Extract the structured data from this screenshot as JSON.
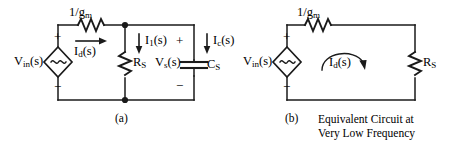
{
  "figure": {
    "stroke_color": "#1a1a1a",
    "background": "#ffffff",
    "panels": [
      {
        "id": "panel-a",
        "caption": "(a)",
        "source": {
          "label": "V",
          "label_sub": "in",
          "label_tail": "(s)",
          "symbol": "~",
          "plus": "+",
          "minus": "−",
          "type": "dependent-ac-source"
        },
        "series_resistor": {
          "label": "1/g",
          "label_sub": "m",
          "current_label": "I",
          "current_sub": "d",
          "current_tail": "(s)",
          "current_direction": "right"
        },
        "shunt_resistor": {
          "label": "R",
          "label_sub": "S",
          "current_label": "I",
          "current_sub": "1",
          "current_tail": "(s)",
          "current_direction": "down"
        },
        "capacitor": {
          "label": "C",
          "label_sub": "S",
          "current_label": "I",
          "current_sub": "c",
          "current_tail": "(s)",
          "current_direction": "down"
        },
        "node_voltage": {
          "label": "V",
          "label_sub": "s",
          "label_tail": "(s)",
          "plus": "+",
          "minus": "−"
        }
      },
      {
        "id": "panel-b",
        "caption_tag": "(b)",
        "caption_line1": "Equivalent Circuit at",
        "caption_line2": "Very Low Frequency",
        "source": {
          "label": "V",
          "label_sub": "in",
          "label_tail": "(s)",
          "symbol": "~",
          "plus": "+",
          "minus": "−",
          "type": "dependent-ac-source"
        },
        "series_resistor": {
          "label": "1/g",
          "label_sub": "m"
        },
        "load_resistor": {
          "label": "R",
          "label_sub": "S"
        },
        "loop_current": {
          "label": "I",
          "label_sub": "d",
          "label_tail": "(s)",
          "direction": "clockwise"
        }
      }
    ]
  }
}
